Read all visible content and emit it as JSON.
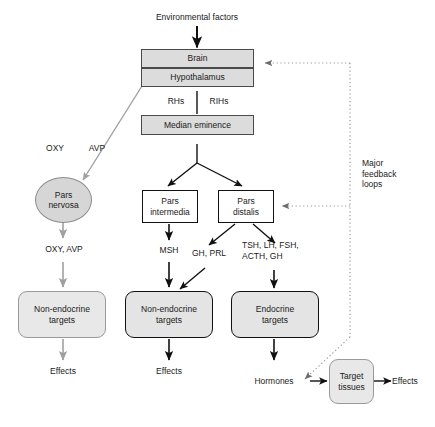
{
  "diagram": {
    "colors": {
      "box_fill_gray": "#dcdcdc",
      "box_fill_white": "#ffffff",
      "round_fill": "#e4e4e4",
      "stroke_black": "#111111",
      "stroke_gray": "#9a9a9a",
      "dotted_feedback": "#9a9a9a"
    },
    "nodes": {
      "environmental_factors": "Environmental factors",
      "brain": "Brain",
      "hypothalamus": "Hypothalamus",
      "median_eminence": "Median eminence",
      "pars_nervosa": "Pars\nnervosa",
      "pars_intermedia": "Pars\nintermedia",
      "pars_distalis": "Pars\ndistalis",
      "target_tissues": "Target\ntissues",
      "non_endocrine_targets_1": "Non-endocrine\ntargets",
      "non_endocrine_targets_2": "Non-endocrine\ntargets",
      "endocrine_targets": "Endocrine\ntargets"
    },
    "edge_labels": {
      "rhs": "RHs",
      "rihs": "RIHs",
      "oxy": "OXY",
      "avp": "AVP",
      "oxy_avp": "OXY, AVP",
      "msh": "MSH",
      "gh_prl": "GH, PRL",
      "anterior_hormones": "TSH, LH, FSH,\nACTH, GH",
      "hormones": "Hormones",
      "effects_1": "Effects",
      "effects_2": "Effects",
      "effects_3": "Effects",
      "major_feedback_loops": "Major\nfeedback\nloops"
    }
  }
}
